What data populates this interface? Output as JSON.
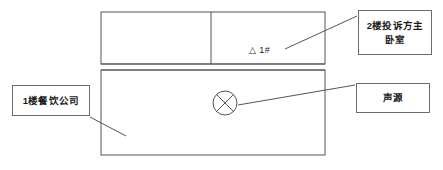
{
  "figure": {
    "type": "building-cross-section-diagram",
    "line_color": "#555555",
    "box_border_color": "#6b6b6b",
    "background": "#ffffff"
  },
  "building": {
    "upper_floor": {
      "name": "2nd floor",
      "left_room": {
        "label": ""
      },
      "right_room": {
        "label": "",
        "measurement_point": {
          "symbol": "triangle",
          "text": "△ 1#",
          "name": "1#"
        }
      }
    },
    "lower_floor": {
      "name": "1st floor",
      "sound_source": {
        "symbol": "crossed-circle",
        "name": "声源"
      }
    }
  },
  "callouts": [
    {
      "id": "bedroom",
      "lines": [
        "2楼投诉方主",
        "卧室"
      ],
      "full_text": "2楼投诉方主卧室",
      "points_to": "measurement-point-1#"
    },
    {
      "id": "source",
      "lines": [
        "声源"
      ],
      "full_text": "声源",
      "points_to": "sound-source-symbol"
    },
    {
      "id": "restaurant",
      "lines": [
        "1楼餐饮公司"
      ],
      "full_text": "1楼餐饮公司",
      "points_to": "lower-floor-area"
    }
  ]
}
